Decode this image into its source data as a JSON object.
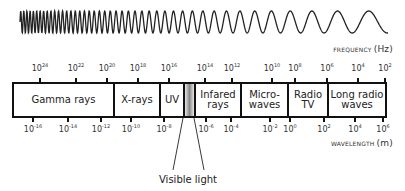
{
  "frequency_axis": {
    "title": "FREQUENCY",
    "unit": "(Hz)",
    "ticks": [
      {
        "base": "10",
        "exp": "24",
        "x": 40
      },
      {
        "base": "10",
        "exp": "22",
        "x": 76
      },
      {
        "base": "10",
        "exp": "20",
        "x": 107
      },
      {
        "base": "10",
        "exp": "18",
        "x": 138
      },
      {
        "base": "10",
        "exp": "16",
        "x": 169
      },
      {
        "base": "10",
        "exp": "14",
        "x": 205
      },
      {
        "base": "10",
        "exp": "12",
        "x": 232
      },
      {
        "base": "10",
        "exp": "10",
        "x": 272
      },
      {
        "base": "10",
        "exp": "8",
        "x": 295
      },
      {
        "base": "10",
        "exp": "6",
        "x": 327
      },
      {
        "base": "10",
        "exp": "4",
        "x": 358
      },
      {
        "base": "10",
        "exp": "2",
        "x": 385
      }
    ]
  },
  "wavelength_axis": {
    "title": "WAVELENGTH",
    "unit": "(m)",
    "ticks": [
      {
        "base": "10",
        "exp": "-16",
        "x": 33
      },
      {
        "base": "10",
        "exp": "-14",
        "x": 68
      },
      {
        "base": "10",
        "exp": "-12",
        "x": 101
      },
      {
        "base": "10",
        "exp": "-10",
        "x": 131
      },
      {
        "base": "10",
        "exp": "-8",
        "x": 164
      },
      {
        "base": "10",
        "exp": "-6",
        "x": 206
      },
      {
        "base": "10",
        "exp": "-4",
        "x": 231
      },
      {
        "base": "10",
        "exp": "-2",
        "x": 270
      },
      {
        "base": "10",
        "exp": "0",
        "x": 290
      },
      {
        "base": "10",
        "exp": "2",
        "x": 324
      },
      {
        "base": "10",
        "exp": "4",
        "x": 355
      },
      {
        "base": "10",
        "exp": "6",
        "x": 383
      }
    ]
  },
  "bands": [
    {
      "id": "gamma",
      "label": "Gamma rays",
      "left": 0,
      "width": 101
    },
    {
      "id": "xrays",
      "label": "X-rays",
      "left": 101,
      "width": 46
    },
    {
      "id": "uv",
      "label": "UV",
      "left": 147,
      "width": 24
    },
    {
      "id": "visible",
      "label": "",
      "left": 171,
      "width": 11
    },
    {
      "id": "infrared",
      "label": "Infared rays",
      "left": 182,
      "width": 46
    },
    {
      "id": "microwaves",
      "label": "Micro-waves",
      "left": 228,
      "width": 47
    },
    {
      "id": "radio",
      "label": "Radio TV",
      "left": 275,
      "width": 40
    },
    {
      "id": "longradio",
      "label": "Long radio waves",
      "left": 315,
      "width": 56
    }
  ],
  "bands_text": {
    "gamma": "Gamma rays",
    "xrays": "X-rays",
    "uv": "UV",
    "infrared_line1": "Infared",
    "infrared_line2": "rays",
    "microwaves_line1": "Micro-",
    "microwaves_line2": "waves",
    "radio_line1": "Radio",
    "radio_line2": "TV",
    "longradio_line1": "Long radio",
    "longradio_line2": "waves"
  },
  "visible_light_label": "Visible light",
  "colors": {
    "line": "#111111",
    "text": "#222222",
    "visible_gradient_center": "#888888"
  }
}
